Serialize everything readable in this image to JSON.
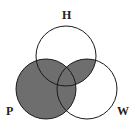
{
  "diagram": {
    "type": "venn-3",
    "sets": [
      {
        "id": "H",
        "label": "H"
      },
      {
        "id": "P",
        "label": "P"
      },
      {
        "id": "W",
        "label": "W"
      }
    ],
    "shaded_regions": [
      "P only",
      "P∩H",
      "P∩W",
      "P∩H∩W",
      "H∩W"
    ],
    "unshaded_regions": [
      "H only",
      "W only"
    ],
    "colors": {
      "shade": "#6e6e6e",
      "stroke": "#1a1a1a",
      "background": "#ffffff"
    }
  }
}
